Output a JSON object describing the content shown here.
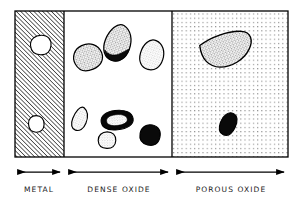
{
  "figure": {
    "background_color": "#ffffff",
    "line_color": "#000000",
    "frame": {
      "x": 15,
      "y": 11,
      "width": 273,
      "height": 146
    },
    "dividers": [
      {
        "name": "metal-dense-boundary",
        "x": 64
      },
      {
        "name": "dense-porous-boundary",
        "x": 172
      }
    ],
    "regions": [
      {
        "id": "metal",
        "label": "METAL",
        "fill_pattern": "diagonal-hatch",
        "hatch_angle_deg": 45,
        "hatch_spacing_px": 3,
        "x": 15,
        "width": 49,
        "arrow": {
          "x1": 16,
          "x2": 62,
          "y": 172
        },
        "label_x": 0,
        "label_width": 78,
        "inclusions": [
          {
            "name": "void-upper",
            "cx": 40,
            "cy": 45,
            "rx": 11,
            "ry": 9.5,
            "rotation": -18,
            "fill": "#ffffff",
            "style": "white-void"
          },
          {
            "name": "void-lower",
            "cx": 36,
            "cy": 124,
            "rx": 8,
            "ry": 8,
            "rotation": 10,
            "fill": "#ffffff",
            "style": "white-void"
          }
        ]
      },
      {
        "id": "dense-oxide",
        "label": "DENSE OXIDE",
        "fill_pattern": "plain",
        "x": 64,
        "width": 108,
        "arrow": {
          "x1": 66,
          "x2": 170,
          "y": 172
        },
        "label_x": 66,
        "label_width": 106,
        "inclusions": [
          {
            "name": "particle-stipple-1",
            "cx": 88,
            "cy": 57,
            "rx": 15,
            "ry": 13,
            "rotation": -25,
            "style": "coarse-stipple"
          },
          {
            "name": "particle-stipple-dark-edge",
            "cx": 118,
            "cy": 43,
            "rx": 13,
            "ry": 18,
            "rotation": 25,
            "style": "stipple-with-black-edge"
          },
          {
            "name": "particle-light-stipple-1",
            "cx": 152,
            "cy": 55,
            "rx": 12,
            "ry": 15,
            "rotation": 18,
            "style": "fine-stipple"
          },
          {
            "name": "particle-light-stipple-2",
            "cx": 80,
            "cy": 119,
            "rx": 7,
            "ry": 12,
            "rotation": 22,
            "style": "fine-stipple"
          },
          {
            "name": "particle-black-ring",
            "cx": 117,
            "cy": 120,
            "rx": 16,
            "ry": 9,
            "rotation": -6,
            "style": "black-ring-light-core"
          },
          {
            "name": "particle-light-stipple-3",
            "cx": 107,
            "cy": 140,
            "rx": 9,
            "ry": 8,
            "rotation": 0,
            "style": "fine-stipple"
          },
          {
            "name": "particle-solid-black-1",
            "cx": 150,
            "cy": 135,
            "rx": 10,
            "ry": 10,
            "rotation": 0,
            "style": "solid-black"
          }
        ]
      },
      {
        "id": "porous-oxide",
        "label": "POROUS OXIDE",
        "fill_pattern": "dot-grid",
        "dot_spacing_px": 4.2,
        "x": 172,
        "width": 116,
        "arrow": {
          "x1": 174,
          "x2": 286,
          "y": 172
        },
        "label_x": 172,
        "label_width": 118,
        "inclusions": [
          {
            "name": "particle-large-stipple",
            "cx": 228,
            "cy": 49,
            "rx": 26,
            "ry": 18,
            "rotation": -18,
            "style": "coarse-stipple-halfmoon"
          },
          {
            "name": "particle-solid-black-2",
            "cx": 228,
            "cy": 124,
            "rx": 8,
            "ry": 12,
            "rotation": 22,
            "style": "solid-black"
          }
        ]
      }
    ],
    "arrows": {
      "head_length_px": 7,
      "head_width_px": 5,
      "stroke_width_px": 1.2,
      "style": "double-headed"
    },
    "colors": {
      "ink": "#000000",
      "paper": "#ffffff",
      "stipple_mid": "#888888",
      "stipple_light": "#c9c9c9",
      "dot_grid": "#9a9a9a"
    }
  }
}
